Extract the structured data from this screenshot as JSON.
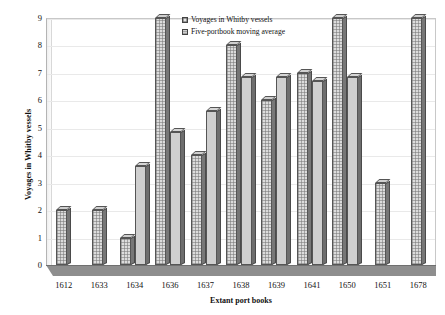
{
  "chart_data": {
    "type": "bar",
    "title": "",
    "xlabel": "Extant port books",
    "ylabel": "Voyages in Whitby vessels",
    "categories": [
      "1612",
      "1633",
      "1634",
      "1636",
      "1637",
      "1638",
      "1639",
      "1641",
      "1650",
      "1651",
      "1678"
    ],
    "series": [
      {
        "name": "Voyages in Whitby vessels",
        "values": [
          2,
          2,
          1,
          9,
          4,
          8,
          6,
          7,
          9,
          3,
          9
        ]
      },
      {
        "name": "Five-portbook moving average",
        "values": [
          null,
          null,
          3.6,
          4.85,
          5.6,
          6.85,
          6.85,
          6.7,
          6.85,
          null,
          null
        ]
      }
    ],
    "ylim": [
      0,
      9
    ],
    "yticks": [
      0,
      1,
      2,
      3,
      4,
      5,
      6,
      7,
      8,
      9
    ],
    "ytick_labels": [
      "0",
      "1",
      "2",
      "3",
      "4",
      "5",
      "6",
      "7",
      "8",
      "9"
    ],
    "grid": true,
    "legend_position": "top-center",
    "style": "3d-clustered-column"
  },
  "legend": {
    "entries": [
      {
        "label": "Voyages in Whitby vessels",
        "swatch": "checkered-pattern-swatch"
      },
      {
        "label": "Five-portbook moving average",
        "swatch": "solid-gray-swatch"
      }
    ]
  },
  "colors": {
    "series1_fill": "#dcdcdc",
    "series2_fill": "#cfcfcf",
    "bar_outline": "#555555",
    "bar_side": "#6b6b6b",
    "floor": "#8e8e8e",
    "gridline": "#e9e9e9",
    "text": "#111111",
    "background": "#ffffff"
  }
}
